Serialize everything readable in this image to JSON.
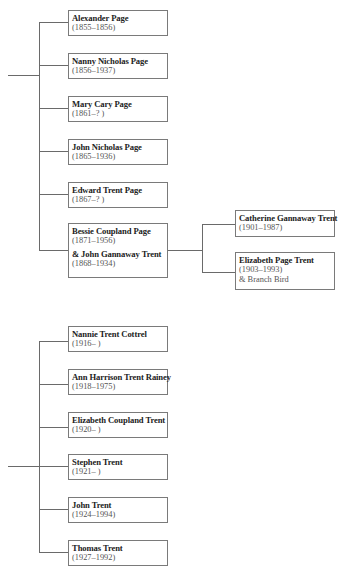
{
  "tree_top": {
    "children": [
      {
        "name": "Alexander Page",
        "dates": "(1855–1856)"
      },
      {
        "name": "Nanny Nicholas Page",
        "dates": "(1856–1937)"
      },
      {
        "name": "Mary Cary Page",
        "dates": "(1861–? )"
      },
      {
        "name": "John Nicholas Page",
        "dates": "(1865–1936)"
      },
      {
        "name": "Edward Trent Page",
        "dates": "(1867–? )"
      },
      {
        "name": "Bessie Coupland Page",
        "dates": "(1871–1956)",
        "spouse_name": "& John Gannaway Trent",
        "spouse_dates": "(1868–1934)"
      }
    ],
    "grandchildren": [
      {
        "name": "Catherine Gannaway Trent",
        "dates": "(1901–1987)"
      },
      {
        "name": "Elizabeth Page Trent",
        "dates": "(1903–1993)",
        "spouse": "& Branch Bird"
      }
    ]
  },
  "tree_bottom": {
    "children": [
      {
        "name": "Nannie Trent Cottrel",
        "dates": "(1916– )"
      },
      {
        "name": "Ann Harrison Trent Rainey",
        "dates": "(1918–1975)"
      },
      {
        "name": "Elizabeth Coupland Trent",
        "dates": "(1920– )"
      },
      {
        "name": "Stephen Trent",
        "dates": "(1921– )"
      },
      {
        "name": "John Trent",
        "dates": "(1924–1994)"
      },
      {
        "name": "Thomas Trent",
        "dates": "(1927–1992)"
      }
    ]
  },
  "colors": {
    "line": "#6a6a6a",
    "border": "#7a7a7a",
    "text": "#222222"
  }
}
